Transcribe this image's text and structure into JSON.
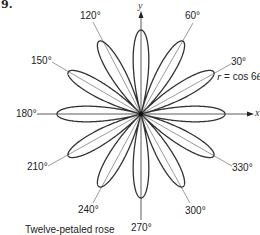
{
  "problem_number": "9.",
  "equation": {
    "r": "r",
    "rest": " = cos 6",
    "theta": "θ"
  },
  "caption": "Twelve-petaled rose",
  "axes": {
    "x_label": "x",
    "y_label": "y"
  },
  "angle_labels": [
    {
      "text": "30°",
      "x": 231,
      "y": 57
    },
    {
      "text": "60°",
      "x": 185,
      "y": 11
    },
    {
      "text": "120°",
      "x": 80,
      "y": 11
    },
    {
      "text": "150°",
      "x": 31,
      "y": 56
    },
    {
      "text": "180°",
      "x": 16,
      "y": 109
    },
    {
      "text": "210°",
      "x": 27,
      "y": 162
    },
    {
      "text": "240°",
      "x": 78,
      "y": 205
    },
    {
      "text": "270°",
      "x": 131,
      "y": 223
    },
    {
      "text": "300°",
      "x": 185,
      "y": 206
    },
    {
      "text": "330°",
      "x": 232,
      "y": 163
    }
  ],
  "chart_data": {
    "type": "polar-curve",
    "equation": "r = cos 6θ",
    "title": "Twelve-petaled rose",
    "petals": 12,
    "petal_angles_deg": [
      0,
      30,
      60,
      90,
      120,
      150,
      180,
      210,
      240,
      270,
      300,
      330
    ],
    "labeled_angles_deg": [
      30,
      60,
      120,
      150,
      180,
      210,
      240,
      270,
      300,
      330
    ],
    "r_max": 1,
    "axes": [
      "x",
      "y"
    ]
  },
  "geometry": {
    "cx": 141,
    "cy": 114,
    "R": 84,
    "stroke": "#333333"
  }
}
